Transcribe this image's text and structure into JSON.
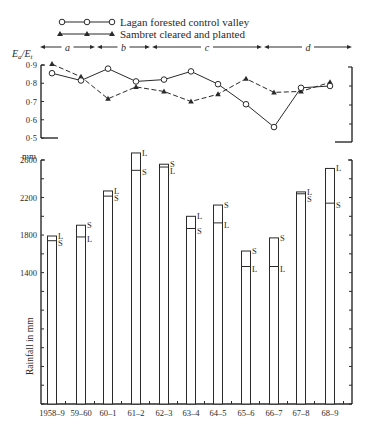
{
  "legend": {
    "lagan_label": "Lagan forested control valley",
    "sambret_label": "Sambret cleared and planted"
  },
  "periods": [
    {
      "label": "a",
      "x0": 40,
      "x1": 95
    },
    {
      "label": "b",
      "x0": 97,
      "x1": 150
    },
    {
      "label": "c",
      "x0": 152,
      "x1": 262
    },
    {
      "label": "d",
      "x0": 264,
      "x1": 352
    }
  ],
  "top_chart": {
    "ylabel": "Ea/Et",
    "ylabel_main": "E",
    "ylabel_sub1": "a",
    "ylabel_sub2": "t",
    "yticks": [
      "0·9",
      "0·8",
      "0·7",
      "0·6",
      "0·5"
    ]
  },
  "bottom_chart": {
    "unit": "mm",
    "ylabel": "Rainfall in mm",
    "yticks": [
      "2600",
      "2200",
      "1800",
      "1400"
    ],
    "bar_label_L": "L",
    "bar_label_S": "S"
  },
  "colors": {
    "ink": "#2a2a2a",
    "background": "#ffffff"
  },
  "chart_data": [
    {
      "type": "line",
      "title": "",
      "xlabel": "",
      "ylabel": "Ea/Et",
      "ylim": [
        0.5,
        0.9
      ],
      "categories": [
        "1958-9",
        "59-60",
        "60-1",
        "61-2",
        "62-3",
        "63-4",
        "64-5",
        "65-6",
        "66-7",
        "67-8",
        "68-9"
      ],
      "series": [
        {
          "name": "Lagan forested control valley",
          "marker": "open-circle",
          "line": "solid",
          "values": [
            0.855,
            0.815,
            0.88,
            0.81,
            0.82,
            0.865,
            0.795,
            0.685,
            0.56,
            0.775,
            0.785
          ]
        },
        {
          "name": "Sambret cleared and planted",
          "marker": "filled-triangle",
          "line": "dashed",
          "values": [
            0.905,
            0.835,
            0.715,
            0.78,
            0.755,
            0.7,
            0.74,
            0.825,
            0.75,
            0.755,
            0.805
          ]
        }
      ],
      "annotations": [
        "a",
        "b",
        "c",
        "d"
      ],
      "grid": false
    },
    {
      "type": "bar",
      "title": "",
      "xlabel": "",
      "ylabel": "Rainfall in mm",
      "ylim": [
        0,
        2600
      ],
      "categories": [
        "1958-9",
        "59-60",
        "60-1",
        "61-2",
        "62-3",
        "63-4",
        "64-5",
        "65-6",
        "66-7",
        "67-8",
        "68-9"
      ],
      "series": [
        {
          "name": "L",
          "values": [
            1790,
            1780,
            2270,
            2675,
            2525,
            2000,
            1930,
            1465,
            1465,
            2260,
            2510
          ]
        },
        {
          "name": "S",
          "values": [
            1740,
            1905,
            2215,
            2490,
            2555,
            1870,
            2120,
            1630,
            1770,
            2240,
            2140
          ]
        }
      ],
      "grid": false
    }
  ]
}
